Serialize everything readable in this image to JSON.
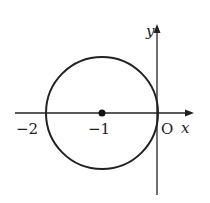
{
  "diagram": {
    "type": "circle-on-axes",
    "axes": {
      "x_label": "x",
      "y_label": "y",
      "origin_label": "O"
    },
    "circle": {
      "center": [
        -1,
        0
      ],
      "radius": 1
    },
    "ticks": [
      {
        "value": -2,
        "label": "−2"
      },
      {
        "value": -1,
        "label": "−1"
      }
    ],
    "center_point_label": "−1",
    "colors": {
      "stroke": "#222222",
      "background": "#ffffff"
    }
  }
}
